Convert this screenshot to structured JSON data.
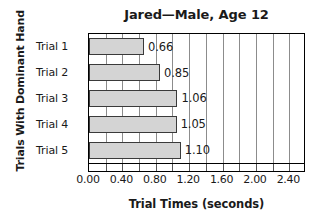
{
  "chart_data": {
    "type": "bar",
    "orientation": "horizontal",
    "title": "Jared—Male, Age 12",
    "xlabel": "Trial Times (seconds)",
    "ylabel": "Trials With Dominant Hand",
    "categories": [
      "Trial 1",
      "Trial 2",
      "Trial 3",
      "Trial 4",
      "Trial 5"
    ],
    "values": [
      0.66,
      0.85,
      1.06,
      1.05,
      1.1
    ],
    "value_labels": [
      "0.66",
      "0.85",
      "1.06",
      "1.05",
      "1.10"
    ],
    "xlim": [
      0.0,
      2.6
    ],
    "xticks": [
      0.0,
      0.4,
      0.8,
      1.2,
      1.6,
      2.0,
      2.4
    ],
    "xtick_labels": [
      "0.00",
      "0.40",
      "0.80",
      "1.20",
      "1.60",
      "2.00",
      "2.40"
    ],
    "gridlines": [
      0.2,
      0.4,
      0.6,
      0.8,
      1.0,
      1.2,
      1.4,
      1.6,
      1.8,
      2.0,
      2.2,
      2.4
    ],
    "minor_tick_step": 0.2,
    "grid": true,
    "legend": false,
    "bar_fill_color": "#d4d4d4",
    "bar_border_color": "#3a3a3a",
    "gridline_color": "#8c8c8c",
    "axis_color": "#000000",
    "text_color": "#1a1a1a"
  }
}
